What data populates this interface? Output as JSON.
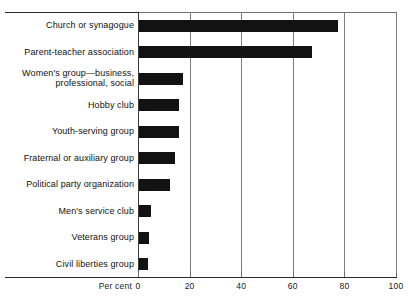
{
  "chart_data": {
    "type": "bar",
    "orientation": "horizontal",
    "title": "",
    "xlabel": "Per cent",
    "ylabel": "",
    "xlim": [
      0,
      100
    ],
    "xticks": [
      0,
      20,
      40,
      60,
      80,
      100
    ],
    "xtick_labels": [
      "0",
      "20",
      "40",
      "60",
      "80",
      "100"
    ],
    "grid": "vertical",
    "legend": "none",
    "bar_color": "#121212",
    "categories": [
      "Church or synagogue",
      "Parent-teacher association",
      "Women's group—business,\nprofessional, social",
      "Hobby club",
      "Youth-serving group",
      "Fraternal or auxiliary group",
      "Political party organization",
      "Men's service club",
      "Veterans group",
      "Civil liberties group"
    ],
    "values": [
      77,
      67,
      17,
      15.5,
      15.5,
      14,
      12,
      4.5,
      4,
      3.5
    ]
  },
  "axis": {
    "title": "Per cent"
  },
  "bars": [
    {
      "label": "Church or synagogue",
      "value": 77
    },
    {
      "label": "Parent-teacher association",
      "value": 67
    },
    {
      "label": "Women's group—business,\nprofessional, social",
      "value": 17
    },
    {
      "label": "Hobby club",
      "value": 15.5
    },
    {
      "label": "Youth-serving group",
      "value": 15.5
    },
    {
      "label": "Fraternal or auxiliary group",
      "value": 14
    },
    {
      "label": "Political party organization",
      "value": 12
    },
    {
      "label": "Men's service club",
      "value": 4.5
    },
    {
      "label": "Veterans group",
      "value": 4
    },
    {
      "label": "Civil liberties group",
      "value": 3.5
    }
  ],
  "ticks": [
    {
      "label": "0",
      "value": 0
    },
    {
      "label": "20",
      "value": 20
    },
    {
      "label": "40",
      "value": 40
    },
    {
      "label": "60",
      "value": 60
    },
    {
      "label": "80",
      "value": 80
    },
    {
      "label": "100",
      "value": 100
    }
  ]
}
